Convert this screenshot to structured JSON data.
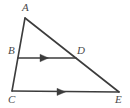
{
  "figure": {
    "type": "geometry-diagram",
    "shape": "triangle",
    "background_color": "#ffffff",
    "stroke_color": "#3c3c3c",
    "label_color": "#4a4a4a",
    "stroke_width": 1.6,
    "labels": {
      "A": "A",
      "B": "B",
      "C": "C",
      "D": "D",
      "E": "E"
    },
    "points": {
      "A": {
        "x": 25,
        "y": 18
      },
      "B": {
        "x": 18,
        "y": 58
      },
      "C": {
        "x": 12,
        "y": 91
      },
      "D": {
        "x": 76,
        "y": 58
      },
      "E": {
        "x": 119,
        "y": 92
      }
    },
    "segments": [
      {
        "name": "AC",
        "from": "A",
        "to": "C",
        "marked": false
      },
      {
        "name": "AE",
        "from": "A",
        "to": "E",
        "marked": false
      },
      {
        "name": "CE",
        "from": "C",
        "to": "E",
        "marked": true,
        "marks": 1
      },
      {
        "name": "BD",
        "from": "B",
        "to": "D",
        "marked": true,
        "marks": 1
      }
    ],
    "arrow_markers": [
      {
        "on": "BD",
        "x": 45,
        "y": 58,
        "direction": "right"
      },
      {
        "on": "CE",
        "x": 62,
        "y": 92,
        "direction": "right"
      }
    ]
  }
}
